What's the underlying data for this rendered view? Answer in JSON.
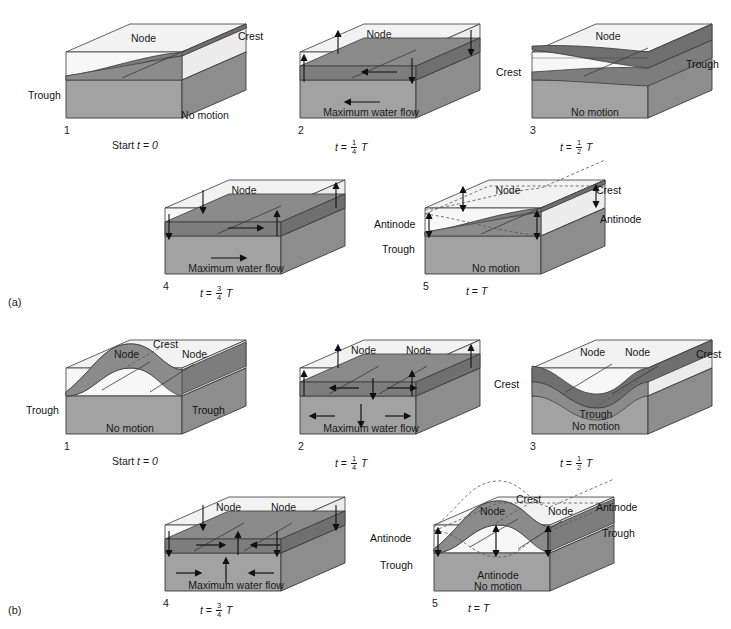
{
  "figure": {
    "type": "scientific-diagram",
    "sections": [
      {
        "id": "a",
        "label": "(a)",
        "mode": "uninodal",
        "node_count": 1,
        "panels": [
          {
            "number": "1",
            "time_label_prefix": "Start",
            "time_var": "t",
            "time_eq": "=",
            "time_value": "0",
            "time_fraction_num": "",
            "time_fraction_den": "",
            "time_has_T": false,
            "surface_state": "tilted",
            "body_label": "No motion",
            "labels": [
              {
                "text": "Node",
                "role": "node"
              },
              {
                "text": "Crest",
                "role": "crest"
              },
              {
                "text": "Trough",
                "role": "trough"
              }
            ],
            "arrows": []
          },
          {
            "number": "2",
            "time_label_prefix": "",
            "time_var": "t",
            "time_eq": "=",
            "time_value": "",
            "time_fraction_num": "1",
            "time_fraction_den": "4",
            "time_has_T": true,
            "surface_state": "level",
            "body_label": "Maximum water flow",
            "labels": [
              {
                "text": "Node",
                "role": "node"
              }
            ],
            "arrows": [
              {
                "dir": "left",
                "where": "mid-water"
              },
              {
                "dir": "left",
                "where": "lower-body"
              },
              {
                "dir": "vertical",
                "where": "end-antinodes"
              }
            ]
          },
          {
            "number": "3",
            "time_label_prefix": "",
            "time_var": "t",
            "time_eq": "=",
            "time_value": "",
            "time_fraction_num": "1",
            "time_fraction_den": "2",
            "time_has_T": true,
            "surface_state": "tilted-reversed",
            "body_label": "No motion",
            "labels": [
              {
                "text": "Node",
                "role": "node"
              },
              {
                "text": "Crest",
                "role": "crest"
              },
              {
                "text": "Trough",
                "role": "trough"
              }
            ],
            "arrows": []
          },
          {
            "number": "4",
            "time_label_prefix": "",
            "time_var": "t",
            "time_eq": "=",
            "time_value": "",
            "time_fraction_num": "3",
            "time_fraction_den": "4",
            "time_has_T": true,
            "surface_state": "level",
            "body_label": "Maximum water flow",
            "labels": [
              {
                "text": "Node",
                "role": "node"
              },
              {
                "text": "Antinode",
                "role": "antinode"
              },
              {
                "text": "Trough",
                "role": "trough"
              }
            ],
            "arrows": [
              {
                "dir": "right",
                "where": "mid-water"
              },
              {
                "dir": "right",
                "where": "lower-body"
              },
              {
                "dir": "vertical",
                "where": "end-antinodes"
              }
            ]
          },
          {
            "number": "5",
            "time_label_prefix": "",
            "time_var": "t",
            "time_eq": "=",
            "time_value": "T",
            "time_fraction_num": "",
            "time_fraction_den": "",
            "time_has_T": false,
            "surface_state": "tilted",
            "body_label": "No motion",
            "labels": [
              {
                "text": "Node",
                "role": "node"
              },
              {
                "text": "Crest",
                "role": "crest"
              },
              {
                "text": "Trough",
                "role": "trough"
              },
              {
                "text": "Antinode",
                "role": "antinode"
              },
              {
                "text": "Antinode",
                "role": "antinode"
              }
            ],
            "arrows": [
              {
                "dir": "double-vertical",
                "where": "left-antinode"
              },
              {
                "dir": "double-vertical",
                "where": "right-antinode"
              }
            ]
          }
        ]
      },
      {
        "id": "b",
        "label": "(b)",
        "mode": "binodal",
        "node_count": 2,
        "panels": [
          {
            "number": "1",
            "time_label_prefix": "Start",
            "time_var": "t",
            "time_eq": "=",
            "time_value": "0",
            "time_fraction_num": "",
            "time_fraction_den": "",
            "time_has_T": false,
            "surface_state": "single-hump",
            "body_label": "No motion",
            "labels": [
              {
                "text": "Node",
                "role": "node"
              },
              {
                "text": "Node",
                "role": "node"
              },
              {
                "text": "Crest",
                "role": "crest"
              },
              {
                "text": "Trough",
                "role": "trough"
              },
              {
                "text": "Trough",
                "role": "trough"
              }
            ],
            "arrows": []
          },
          {
            "number": "2",
            "time_label_prefix": "",
            "time_var": "t",
            "time_eq": "=",
            "time_value": "",
            "time_fraction_num": "1",
            "time_fraction_den": "4",
            "time_has_T": true,
            "surface_state": "level",
            "body_label": "Maximum water flow",
            "labels": [
              {
                "text": "Node",
                "role": "node"
              },
              {
                "text": "Node",
                "role": "node"
              }
            ],
            "arrows": [
              {
                "dir": "converging",
                "where": "mid-water"
              },
              {
                "dir": "down",
                "where": "center"
              },
              {
                "dir": "vertical",
                "where": "end-antinodes"
              }
            ]
          },
          {
            "number": "3",
            "time_label_prefix": "",
            "time_var": "t",
            "time_eq": "=",
            "time_value": "",
            "time_fraction_num": "1",
            "time_fraction_den": "2",
            "time_has_T": true,
            "surface_state": "single-dip",
            "body_label": "No motion",
            "labels": [
              {
                "text": "Node",
                "role": "node"
              },
              {
                "text": "Node",
                "role": "node"
              },
              {
                "text": "Crest",
                "role": "crest"
              },
              {
                "text": "Crest",
                "role": "crest"
              },
              {
                "text": "Trough",
                "role": "trough"
              }
            ],
            "arrows": []
          },
          {
            "number": "4",
            "time_label_prefix": "",
            "time_var": "t",
            "time_eq": "=",
            "time_value": "",
            "time_fraction_num": "3",
            "time_fraction_den": "4",
            "time_has_T": true,
            "surface_state": "level",
            "body_label": "Maximum water flow",
            "labels": [
              {
                "text": "Node",
                "role": "node"
              },
              {
                "text": "Node",
                "role": "node"
              },
              {
                "text": "Antinode",
                "role": "antinode"
              },
              {
                "text": "Trough",
                "role": "trough"
              }
            ],
            "arrows": [
              {
                "dir": "diverging",
                "where": "mid-water"
              },
              {
                "dir": "up",
                "where": "center"
              },
              {
                "dir": "vertical",
                "where": "end-antinodes"
              }
            ]
          },
          {
            "number": "5",
            "time_label_prefix": "",
            "time_var": "t",
            "time_eq": "=",
            "time_value": "T",
            "time_fraction_num": "",
            "time_fraction_den": "",
            "time_has_T": false,
            "surface_state": "single-hump",
            "body_label": "No motion",
            "labels": [
              {
                "text": "Node",
                "role": "node"
              },
              {
                "text": "Node",
                "role": "node"
              },
              {
                "text": "Crest",
                "role": "crest"
              },
              {
                "text": "Antinode",
                "role": "antinode"
              },
              {
                "text": "Antinode",
                "role": "antinode"
              },
              {
                "text": "Antinode",
                "role": "antinode"
              },
              {
                "text": "Trough",
                "role": "trough"
              },
              {
                "text": "Trough",
                "role": "trough"
              }
            ],
            "arrows": [
              {
                "dir": "double-vertical",
                "where": "left-antinode"
              },
              {
                "dir": "double-vertical",
                "where": "center-antinode"
              },
              {
                "dir": "double-vertical",
                "where": "right-antinode"
              }
            ]
          }
        ]
      }
    ],
    "text": {
      "node": "Node",
      "crest": "Crest",
      "trough": "Trough",
      "antinode": "Antinode",
      "no_motion": "No motion",
      "max_flow": "Maximum water flow",
      "start": "Start",
      "t": "t",
      "eq": "=",
      "zero": "0",
      "T": "T"
    },
    "colors": {
      "background": "#ffffff",
      "top_air": "#f2f2f2",
      "water_front": "#9e9e9e",
      "water_side": "#8a8a8a",
      "water_surface_dark": "#7d7d7d",
      "outline": "#3a3a3a",
      "text": "#1a1a1a",
      "dashed": "#555555"
    }
  }
}
